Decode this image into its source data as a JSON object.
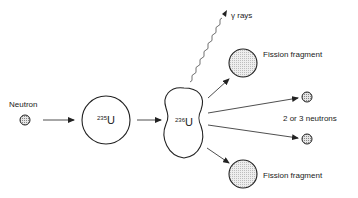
{
  "diagram": {
    "labels": {
      "neutron": "Neutron",
      "u235_mass": "235",
      "u235_symbol": "U",
      "u236_mass": "236",
      "u236_symbol": "U",
      "gamma": "γ rays",
      "fragment_top": "Fission fragment",
      "fragment_bottom": "Fission fragment",
      "neutrons_out": "2 or 3 neutrons"
    },
    "colors": {
      "stroke": "#222222",
      "fill_particle": "#cccccc",
      "fill_fragment": "#e2e2e2"
    }
  }
}
